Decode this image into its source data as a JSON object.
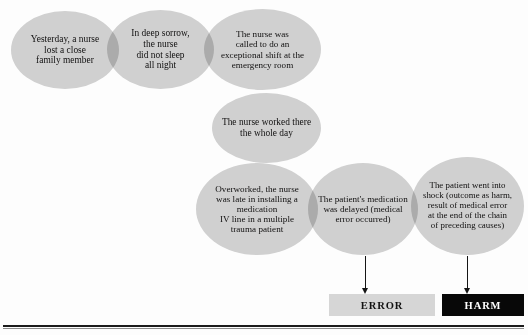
{
  "figure": {
    "type": "flow-diagram",
    "background_color": "#fdfdfd",
    "node_fill_color": "#d2d2d2",
    "text_color": "#111111"
  },
  "nodes": [
    {
      "id": "node-1",
      "name": "family-loss",
      "text": "Yesterday, a nurse\nlost a close\nfamily member"
    },
    {
      "id": "node-2",
      "name": "no-sleep",
      "text": "In deep sorrow,\nthe nurse\ndid not sleep\nall night"
    },
    {
      "id": "node-3",
      "name": "exceptional-shift",
      "text": "The nurse was\ncalled to do an\nexceptional shift at the\nemergency room"
    },
    {
      "id": "node-4",
      "name": "worked-whole-day",
      "text": "The nurse worked there\nthe whole day"
    },
    {
      "id": "node-5",
      "name": "overworked-late-iv",
      "text": "Overworked, the nurse\nwas late in installing a\nmedication\nIV line in a multiple\ntrauma patient"
    },
    {
      "id": "node-6",
      "name": "medication-delayed",
      "text": "The patient's medication\nwas delayed (medical\nerror occurred)"
    },
    {
      "id": "node-7",
      "name": "patient-shock",
      "text": "The patient went into\nshock (outcome as harm,\nresult of medical error\nat the end of the chain\nof preceding causes)"
    }
  ],
  "outcomes": [
    {
      "id": "outcome-error",
      "label": "ERROR",
      "fill": "#d6d6d6",
      "text_color": "#121212"
    },
    {
      "id": "outcome-harm",
      "label": "HARM",
      "fill": "#080808",
      "text_color": "#ffffff"
    }
  ],
  "connectors": [
    {
      "id": "arrow-error",
      "from": "node-6",
      "to": "outcome-error",
      "style": "down-arrow"
    },
    {
      "id": "arrow-harm",
      "from": "node-7",
      "to": "outcome-harm",
      "style": "down-arrow"
    }
  ]
}
